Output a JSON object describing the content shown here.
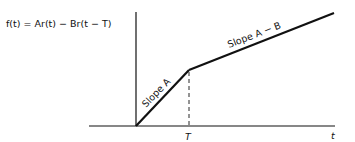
{
  "diagram": {
    "equation": "f(t) = Ar(t) − Br(t − T)",
    "segment_labels": {
      "first": "Slope A",
      "second": "Slope A − B"
    },
    "axis_labels": {
      "x": "t",
      "breakpoint": "T"
    },
    "colors": {
      "line": "#111111",
      "axis": "#111111",
      "background": "#ffffff"
    }
  }
}
